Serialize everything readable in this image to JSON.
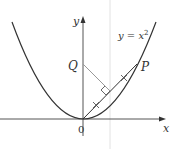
{
  "diagram": {
    "axes": {
      "x_label": "x",
      "y_label": "y",
      "origin_label": "0"
    },
    "curve": {
      "equation_lhs": "y = x",
      "equation_exp": "2",
      "type": "parabola"
    },
    "points": [
      {
        "label": "P",
        "on": "curve"
      },
      {
        "label": "Q",
        "on": "y-axis"
      }
    ],
    "segments": [
      "OP chord with two equal-length tick marks",
      "QM perpendicular to OP at its midpoint"
    ],
    "colors": {
      "curve": "#333333",
      "axis": "#555555",
      "perpendicular": "#999999",
      "guide": "#dddddd"
    }
  }
}
